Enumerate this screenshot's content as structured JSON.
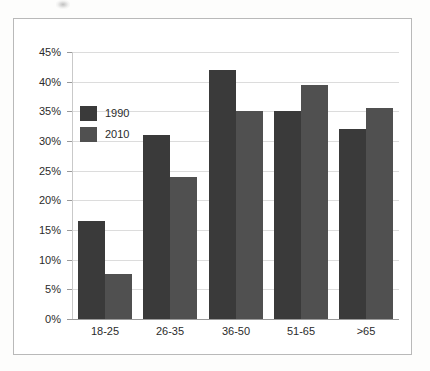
{
  "figure": {
    "background_color": "#ffffff",
    "border_color": "#b9b9b9",
    "page_background": "#fdfdfc"
  },
  "chart_data": {
    "type": "bar",
    "title": "",
    "subtitle": "",
    "xlabel": "",
    "ylabel": "",
    "categories": [
      "18-25",
      "26-35",
      "36-50",
      "51-65",
      ">65"
    ],
    "series": [
      {
        "name": "1990",
        "color": "#3a3a3a",
        "values": [
          16.5,
          31,
          42,
          35,
          32
        ]
      },
      {
        "name": "2010",
        "color": "#505050",
        "values": [
          7.5,
          24,
          35,
          39.5,
          35.5
        ]
      }
    ],
    "ylim": [
      0,
      45
    ],
    "ytick_step": 5,
    "ytick_labels": [
      "45%",
      "40%",
      "35%",
      "30%",
      "25%",
      "20%",
      "15%",
      "10%",
      "5%",
      "0%"
    ],
    "ytick_values": [
      45,
      40,
      35,
      30,
      25,
      20,
      15,
      10,
      5,
      0
    ],
    "grid": true,
    "grid_color": "#dcdcdc",
    "legend_position": "upper-left-inside",
    "axis_color": "#9a9a9a",
    "value_suffix": "%"
  }
}
